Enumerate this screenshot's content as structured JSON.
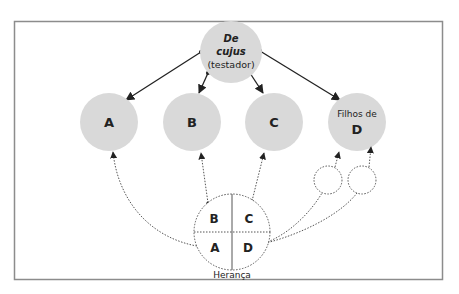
{
  "diagram": {
    "root": {
      "line1": "De",
      "line2": "cujus",
      "line3": "(testador)"
    },
    "heirs": [
      {
        "id": "A",
        "label": "A"
      },
      {
        "id": "B",
        "label": "B"
      },
      {
        "id": "C",
        "label": "C"
      },
      {
        "id": "D",
        "prefix": "Filhos de",
        "label": "D"
      }
    ],
    "inheritance": {
      "caption": "Herança",
      "quadrants": [
        "B",
        "C",
        "A",
        "D"
      ]
    },
    "colors": {
      "node_fill": "#d9d9d9",
      "frame": "#8c8c8c",
      "arrow": "#222222",
      "dotted": "#555555"
    }
  }
}
